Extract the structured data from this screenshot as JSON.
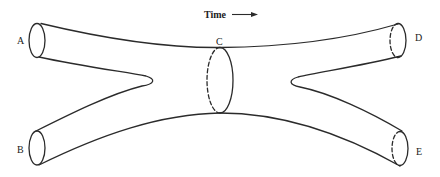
{
  "diagram": {
    "type": "pair-of-pants / tube splitting-joining diagram",
    "time_label": "Time",
    "time_arrow": "→",
    "labels": {
      "A": "A",
      "B": "B",
      "C": "C",
      "D": "D",
      "E": "E"
    },
    "nodes": [
      {
        "id": "A",
        "role": "incoming tube end (top-left)"
      },
      {
        "id": "B",
        "role": "incoming tube end (bottom-left)"
      },
      {
        "id": "C",
        "role": "joined tube cross-section (center)"
      },
      {
        "id": "D",
        "role": "outgoing tube end (top-right)"
      },
      {
        "id": "E",
        "role": "outgoing tube end (bottom-right)"
      }
    ],
    "colors": {
      "stroke": "#2b2b2b",
      "background": "#ffffff"
    }
  }
}
